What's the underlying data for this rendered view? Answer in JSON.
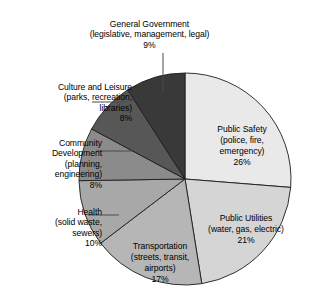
{
  "figure": {
    "title": "",
    "background_color": "#ffffff"
  },
  "chart_data": {
    "type": "pie",
    "title": "",
    "xlabel": "",
    "ylabel": "",
    "legend_position": "none",
    "grid": false,
    "start_angle_deg": 0,
    "direction": "clockwise",
    "units": "percent",
    "categories": [
      "Public Safety",
      "Public Utilities",
      "Transportation",
      "Health",
      "Community Development",
      "Culture and Leisure",
      "General Government"
    ],
    "values": [
      26,
      21,
      17,
      10,
      8,
      8,
      9
    ],
    "slices": [
      {
        "name": "Public Safety",
        "label_line1": "Public Safety",
        "label_line2": "(police, fire,",
        "label_line3": "emergency)",
        "label_text": "Public Safety\n(police, fire,\nemergency)",
        "value": 26,
        "percent_label": "26%",
        "color": "#e9e9e9",
        "label_placement": "inside"
      },
      {
        "name": "Public Utilities",
        "label_line1": "Public Utilities",
        "label_line2": "(water, gas, electric)",
        "label_text": "Public Utilities\n(water, gas, electric)",
        "value": 21,
        "percent_label": "21%",
        "color": "#d5d5d5",
        "label_placement": "inside"
      },
      {
        "name": "Transportation",
        "label_line1": "Transportation",
        "label_line2": "(streets, transit,",
        "label_line3": "airports)",
        "label_text": "Transportation\n(streets, transit,\nairports)",
        "value": 17,
        "percent_label": "17%",
        "color": "#b6b6b6",
        "label_placement": "inside"
      },
      {
        "name": "Health",
        "label_line1": "Health",
        "label_line2": "(solid waste,",
        "label_line3": "sewers)",
        "label_text": "Health\n(solid waste,\nsewers)",
        "value": 10,
        "percent_label": "10%",
        "color": "#a8a8a8",
        "label_placement": "outside"
      },
      {
        "name": "Community Development",
        "label_line1": "Community",
        "label_line2": "Development",
        "label_line3": "(planning,",
        "label_line4": "engineering)",
        "label_text": "Community\nDevelopment\n(planning,\nengineering)",
        "value": 8,
        "percent_label": "8%",
        "color": "#8b8b8b",
        "label_placement": "outside"
      },
      {
        "name": "Culture and Leisure",
        "label_line1": "Culture and Leisure",
        "label_line2": "(parks, recreation,",
        "label_line3": "libraries)",
        "label_text": "Culture and Leisure\n(parks, recreation,\nlibraries)",
        "value": 8,
        "percent_label": "8%",
        "color": "#575757",
        "label_placement": "outside"
      },
      {
        "name": "General Government",
        "label_line1": "General Government",
        "label_line2": "(legislative, management, legal)",
        "label_text": "General Government\n(legislative, management, legal)",
        "value": 9,
        "percent_label": "9%",
        "color": "#393939",
        "label_placement": "outside"
      }
    ]
  },
  "labels": {
    "general_government": {
      "text": "General Government\n(legislative, management, legal)",
      "percent": "9%"
    },
    "culture_leisure": {
      "text": "Culture and Leisure\n(parks, recreation,\nlibraries)",
      "percent": "8%"
    },
    "community_development": {
      "text": "Community\nDevelopment\n(planning,\nengineering)",
      "percent": "8%"
    },
    "health": {
      "text": "Health\n(solid waste,\nsewers)",
      "percent": "10%"
    },
    "public_safety": {
      "text": "Public Safety\n(police, fire,\nemergency)",
      "percent": "26%"
    },
    "public_utilities": {
      "text": "Public Utilities\n(water, gas, electric)",
      "percent": "21%"
    },
    "transportation": {
      "text": "Transportation\n(streets, transit,\nairports)",
      "percent": "17%"
    }
  }
}
